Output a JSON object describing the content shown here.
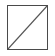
{
  "swatch": {
    "icon": "no-color-icon",
    "label": "No color",
    "border_color": "#4a4a4a",
    "fill_color": "#ffffff",
    "slash_color": "#555555"
  }
}
